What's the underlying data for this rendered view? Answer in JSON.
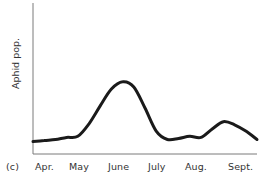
{
  "chart_data": {
    "type": "line",
    "title": "",
    "panel_label": "(c)",
    "xlabel": "",
    "ylabel": "Aphid pop.",
    "categories": [
      "Apr.",
      "May",
      "June",
      "July",
      "Aug.",
      "Sept."
    ],
    "grid": false,
    "legend": null,
    "ylim": [
      0,
      100
    ],
    "series": [
      {
        "name": "Aphid population",
        "x": [
          0.0,
          0.25,
          0.5,
          0.75,
          1.0,
          1.25,
          1.5,
          1.75,
          2.0,
          2.25,
          2.5,
          2.75,
          3.0,
          3.25,
          3.5,
          3.75,
          4.0,
          4.25,
          4.5,
          4.75,
          5.0
        ],
        "values": [
          8,
          9,
          10,
          12,
          13,
          25,
          42,
          58,
          65,
          60,
          40,
          18,
          10,
          11,
          13,
          12,
          20,
          27,
          24,
          18,
          10
        ]
      }
    ],
    "style": {
      "line_color": "#1a1a1a",
      "axis_color": "#777777"
    }
  },
  "labels": {
    "panel": "(c)",
    "ylabel": "Aphid pop.",
    "months": [
      "Apr.",
      "May",
      "June",
      "July",
      "Aug.",
      "Sept."
    ]
  }
}
